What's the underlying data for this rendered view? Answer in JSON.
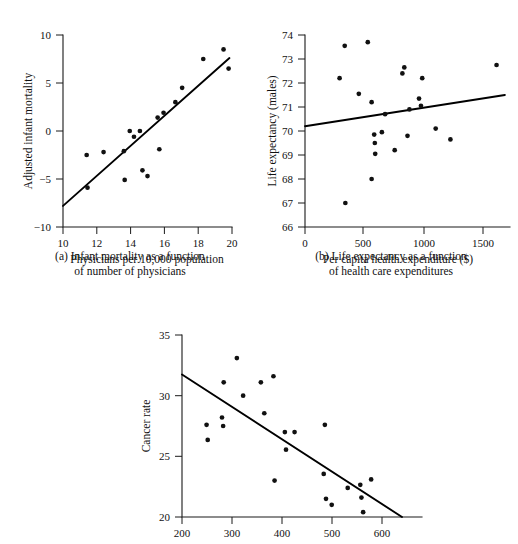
{
  "figure": {
    "background_color": "#ffffff",
    "ink_color": "#111111",
    "panels": [
      "a",
      "b",
      "c"
    ]
  },
  "captions": {
    "a": "(a) Infant mortality as a function\nof number of physicians",
    "b": "(b) Life expectancy as a function\nof health care expenditures"
  },
  "chart_data": [
    {
      "id": "a",
      "type": "scatter",
      "title": "",
      "xlabel": "Physicians per 10,000 population",
      "ylabel": "Adjusted infant mortality",
      "xlim": [
        10,
        20
      ],
      "ylim": [
        -10,
        10
      ],
      "xticks": [
        10,
        12,
        14,
        16,
        18,
        20
      ],
      "xtick_labels": [
        "10",
        "12",
        "14",
        "16",
        "18",
        "20"
      ],
      "yticks": [
        -10,
        -5,
        0,
        5,
        10
      ],
      "ytick_labels": [
        "−10",
        "−5",
        "0",
        "5",
        "10"
      ],
      "grid": false,
      "legend": "none",
      "points": [
        [
          11.4,
          -2.5
        ],
        [
          11.45,
          -5.9
        ],
        [
          12.4,
          -2.2
        ],
        [
          13.6,
          -2.1
        ],
        [
          13.65,
          -5.1
        ],
        [
          13.95,
          0.0
        ],
        [
          14.2,
          -0.6
        ],
        [
          14.55,
          0.0
        ],
        [
          14.7,
          -4.1
        ],
        [
          15.0,
          -4.7
        ],
        [
          15.6,
          1.4
        ],
        [
          15.7,
          -1.9
        ],
        [
          15.95,
          1.9
        ],
        [
          16.65,
          3.0
        ],
        [
          17.05,
          4.5
        ],
        [
          18.3,
          7.5
        ],
        [
          19.5,
          8.5
        ],
        [
          19.8,
          6.5
        ]
      ],
      "fit_line": {
        "x": [
          10,
          19.85
        ],
        "y": [
          -7.8,
          7.6
        ]
      }
    },
    {
      "id": "b",
      "type": "scatter",
      "title": "",
      "xlabel": "Per capita health expenditure ($)",
      "ylabel": "Life expectancy (males)",
      "xlim": [
        0,
        1600
      ],
      "ylim": [
        66,
        74
      ],
      "xticks": [
        0,
        500,
        1000,
        1500
      ],
      "xtick_labels": [
        "0",
        "500",
        "1000",
        "1500"
      ],
      "yticks": [
        66,
        67,
        68,
        69,
        70,
        71,
        72,
        73,
        74
      ],
      "ytick_labels": [
        "66",
        "67",
        "68",
        "69",
        "70",
        "71",
        "72",
        "73",
        "74"
      ],
      "grid": false,
      "legend": "none",
      "points": [
        [
          270,
          72.2
        ],
        [
          310,
          73.55
        ],
        [
          315,
          67.0
        ],
        [
          420,
          71.55
        ],
        [
          490,
          73.7
        ],
        [
          520,
          71.2
        ],
        [
          520,
          68.0
        ],
        [
          540,
          69.85
        ],
        [
          545,
          69.5
        ],
        [
          548,
          69.05
        ],
        [
          600,
          69.95
        ],
        [
          625,
          70.7
        ],
        [
          700,
          69.2
        ],
        [
          760,
          72.4
        ],
        [
          775,
          72.65
        ],
        [
          800,
          69.8
        ],
        [
          815,
          70.9
        ],
        [
          890,
          71.35
        ],
        [
          905,
          71.05
        ],
        [
          915,
          72.2
        ],
        [
          1020,
          70.1
        ],
        [
          1135,
          69.65
        ],
        [
          1495,
          72.75
        ]
      ],
      "fit_line": {
        "x": [
          0,
          1560
        ],
        "y": [
          70.2,
          71.5
        ]
      }
    },
    {
      "id": "c",
      "type": "scatter",
      "title": "",
      "xlabel": "",
      "ylabel": "Cancer rate",
      "xlim": [
        200,
        620
      ],
      "ylim": [
        20,
        35
      ],
      "xticks": [
        200,
        300,
        400,
        500,
        600
      ],
      "xtick_labels": [
        "200",
        "300",
        "400",
        "500",
        "600"
      ],
      "yticks": [
        20,
        25,
        30,
        35
      ],
      "ytick_labels": [
        "20",
        "25",
        "30",
        "35"
      ],
      "grid": false,
      "legend": "none",
      "points": [
        [
          243,
          27.6
        ],
        [
          245,
          26.35
        ],
        [
          270,
          28.2
        ],
        [
          272,
          27.5
        ],
        [
          273,
          31.1
        ],
        [
          296,
          33.1
        ],
        [
          307,
          30.0
        ],
        [
          338,
          31.1
        ],
        [
          344,
          28.55
        ],
        [
          360,
          31.6
        ],
        [
          362,
          23.0
        ],
        [
          380,
          27.0
        ],
        [
          382,
          25.55
        ],
        [
          397,
          27.0
        ],
        [
          448,
          23.55
        ],
        [
          450,
          27.6
        ],
        [
          452,
          21.5
        ],
        [
          462,
          21.0
        ],
        [
          490,
          22.4
        ],
        [
          512,
          22.65
        ],
        [
          514,
          21.6
        ],
        [
          517,
          20.4
        ],
        [
          531,
          23.1
        ]
      ],
      "fit_line": {
        "x": [
          200,
          585
        ],
        "y": [
          31.75,
          20.0
        ]
      }
    }
  ]
}
